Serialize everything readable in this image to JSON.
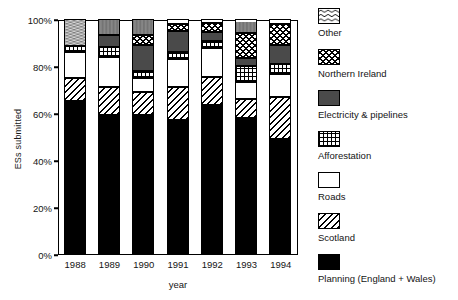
{
  "chart_data": {
    "type": "bar",
    "subtype": "stacked-percentage",
    "title": "",
    "xlabel": "year",
    "ylabel": "ESs submitted",
    "ylim": [
      0,
      100
    ],
    "yunit": "%",
    "ytick_labels": [
      "0%",
      "20%",
      "40%",
      "60%",
      "80%",
      "100%"
    ],
    "ytick_values": [
      0,
      20,
      40,
      60,
      80,
      100
    ],
    "grid": false,
    "legend_position": "right",
    "categories": [
      "1988",
      "1989",
      "1990",
      "1991",
      "1992",
      "1993",
      "1994"
    ],
    "series": [
      {
        "name": "Planning (England + Wales)",
        "pattern": "solid-black",
        "color": "#000000",
        "values": [
          65,
          59,
          59,
          57,
          63.5,
          58,
          49
        ]
      },
      {
        "name": "Scotland",
        "pattern": "diagonal-hatch",
        "color": "#ffffff",
        "values": [
          10,
          12,
          10,
          14,
          12,
          8,
          18
        ]
      },
      {
        "name": "Roads",
        "pattern": "blank-white",
        "color": "#ffffff",
        "values": [
          11,
          13,
          6,
          12,
          12,
          7,
          9.5
        ]
      },
      {
        "name": "Afforestation",
        "pattern": "grid-hatch",
        "color": "#ffffff",
        "values": [
          2.5,
          4,
          3,
          3,
          3,
          7,
          4.5
        ]
      },
      {
        "name": "Electricity & pipelines",
        "pattern": "solid-dark-grey",
        "color": "#4a4a4a",
        "values": [
          0,
          5,
          11,
          9,
          4,
          3.5,
          8
        ]
      },
      {
        "name": "Northern Ireland",
        "pattern": "cross-diagonal-hatch",
        "color": "#ffffff",
        "values": [
          0,
          0,
          4,
          3,
          4,
          10.5,
          9
        ]
      },
      {
        "name": "Other",
        "pattern": "wavy-lines",
        "color": "#ffffff",
        "values": [
          11.5,
          7,
          7,
          2,
          1.5,
          6,
          2
        ]
      }
    ]
  },
  "axes": {
    "y_title": "ESs submitted",
    "x_title": "year"
  },
  "legend": {
    "entries": [
      {
        "label": "Other",
        "swatch": "wavy-lines-swatch"
      },
      {
        "label": "Northern Ireland",
        "swatch": "cross-diagonal-hatch-swatch"
      },
      {
        "label": "Electricity & pipelines",
        "swatch": "solid-dark-grey-swatch"
      },
      {
        "label": "Afforestation",
        "swatch": "grid-hatch-swatch"
      },
      {
        "label": "Roads",
        "swatch": "blank-white-swatch"
      },
      {
        "label": "Scotland",
        "swatch": "diagonal-hatch-swatch"
      },
      {
        "label": "Planning (England + Wales)",
        "swatch": "solid-black-swatch"
      }
    ]
  }
}
